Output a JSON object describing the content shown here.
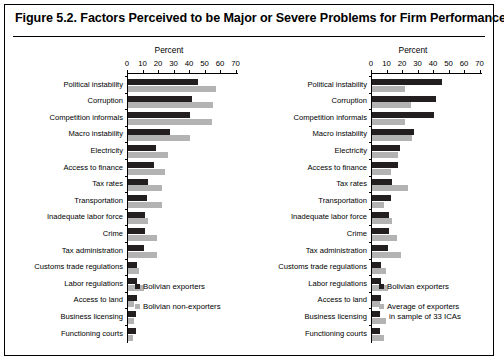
{
  "figure": {
    "title": "Figure 5.2. Factors Perceived to be Major or Severe Problems for Firm Performance"
  },
  "chart_data": [
    {
      "type": "bar",
      "panel": "left",
      "title": "",
      "xlabel": "Percent",
      "ylabel": "",
      "xlim": [
        0,
        70
      ],
      "xticks": [
        0,
        10,
        20,
        30,
        40,
        50,
        60,
        70
      ],
      "grid": false,
      "orientation": "horizontal",
      "legend_position": "bottom-right",
      "categories": [
        "Political instability",
        "Corruption",
        "Competition informals",
        "Macro instability",
        "Electricity",
        "Access to finance",
        "Tax rates",
        "Transportation",
        "Inadequate labor force",
        "Crime",
        "Tax administration",
        "Customs trade regulations",
        "Labor regulations",
        "Access to land",
        "Business licensing",
        "Functioning courts"
      ],
      "series": [
        {
          "name": "Bolivian exporters",
          "color": "#231f20",
          "values": [
            45,
            41,
            40,
            27,
            18,
            17,
            13,
            12,
            11,
            11,
            10,
            6,
            6,
            6,
            5,
            5
          ]
        },
        {
          "name": "Bolivian non-exporters",
          "color": "#b3b3b3",
          "values": [
            57,
            55,
            54,
            40,
            26,
            24,
            22,
            22,
            13,
            19,
            19,
            7,
            10,
            4,
            4,
            3
          ]
        }
      ]
    },
    {
      "type": "bar",
      "panel": "right",
      "title": "",
      "xlabel": "Percent",
      "ylabel": "",
      "xlim": [
        0,
        70
      ],
      "xticks": [
        0,
        10,
        20,
        30,
        40,
        50,
        60,
        70
      ],
      "grid": false,
      "orientation": "horizontal",
      "legend_position": "bottom-right",
      "categories": [
        "Political instability",
        "Corruption",
        "Competition informals",
        "Macro instability",
        "Electricity",
        "Access to finance",
        "Tax rates",
        "Transportation",
        "Inadequate labor force",
        "Crime",
        "Tax administration",
        "Customs trade regulations",
        "Labor regulations",
        "Access to land",
        "Business licensing",
        "Functioning courts"
      ],
      "series": [
        {
          "name": "Bolivian exporters",
          "color": "#231f20",
          "values": [
            45,
            41,
            40,
            27,
            18,
            17,
            13,
            12,
            11,
            11,
            10,
            6,
            6,
            6,
            5,
            5
          ]
        },
        {
          "name": "Average of exporters in sample of 33 ICAs",
          "color": "#b3b3b3",
          "values": [
            21,
            25,
            21,
            26,
            17,
            12,
            23,
            8,
            13,
            16,
            19,
            9,
            10,
            5,
            9,
            8
          ]
        }
      ]
    }
  ],
  "legends": {
    "left": [
      {
        "label": "Bolivian exporters",
        "color": "#231f20"
      },
      {
        "label": "Bolivian non-exporters",
        "color": "#b3b3b3"
      }
    ],
    "right": [
      {
        "label": "Bolivian exporters",
        "color": "#231f20"
      },
      {
        "label": "Average of exporters",
        "label2": "in sample of 33 ICAs",
        "color": "#b3b3b3"
      }
    ]
  }
}
